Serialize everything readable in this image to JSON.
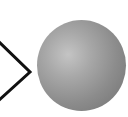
{
  "diagram": {
    "shapes": [
      {
        "type": "chevron-right",
        "stroke": "#111111"
      },
      {
        "type": "sphere",
        "fill": "#9a9a9a",
        "highlight": "#c4c4c4"
      }
    ]
  }
}
